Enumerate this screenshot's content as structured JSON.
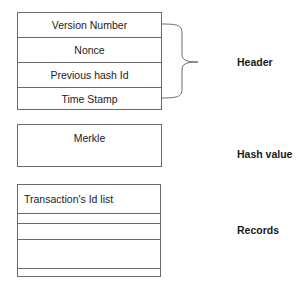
{
  "header_block": {
    "rows": [
      "Version Number",
      "Nonce",
      "Previous hash Id",
      "Time Stamp"
    ],
    "label": "Header"
  },
  "hash_block": {
    "rows": [
      "Merkle"
    ],
    "label": "Hash value"
  },
  "records_block": {
    "rows": [
      "Transaction's Id list",
      "",
      "",
      "",
      ""
    ],
    "label": "Records"
  },
  "colors": {
    "line": "#6a6a6a",
    "text": "#1a1a1a",
    "background": "#ffffff"
  }
}
